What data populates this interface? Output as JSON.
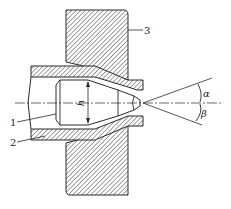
{
  "figure": {
    "type": "technical cross-section drawing",
    "colors": {
      "line": "#2a2a2a",
      "hatch": "#555555",
      "background": "#ffffff"
    }
  },
  "labels": {
    "part_1": "1",
    "part_2": "2",
    "part_3": "3",
    "dimension_h": "h",
    "angle_alpha": "α",
    "angle_beta": "β"
  },
  "parts": [
    {
      "id": "1",
      "description": "nozzle insert"
    },
    {
      "id": "2",
      "description": "nozzle sleeve"
    },
    {
      "id": "3",
      "description": "mounting wall / plate"
    }
  ]
}
